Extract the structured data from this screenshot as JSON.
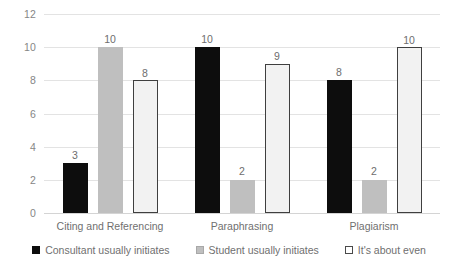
{
  "chart_data": {
    "type": "bar",
    "title": "",
    "subtitle": "",
    "xlabel": "",
    "ylabel": "",
    "ylim": [
      0,
      12
    ],
    "ytick_step": 2,
    "yticks": [
      "12",
      "10",
      "8",
      "6",
      "4",
      "2",
      "0"
    ],
    "grid": true,
    "legend_position": "bottom",
    "categories": [
      "Citing and Referencing",
      "Paraphrasing",
      "Plagiarism"
    ],
    "series": [
      {
        "name": "Consultant usually initiates",
        "color": "#0d0d0d",
        "values": [
          3,
          10,
          8
        ],
        "labels": [
          "3",
          "10",
          "8"
        ]
      },
      {
        "name": "Student usually initiates",
        "color": "#bfbfbf",
        "values": [
          10,
          2,
          2
        ],
        "labels": [
          "10",
          "2",
          "2"
        ]
      },
      {
        "name": "It's about even",
        "color": "#f2f2f2",
        "values": [
          8,
          9,
          10
        ],
        "labels": [
          "8",
          "9",
          "10"
        ]
      }
    ]
  },
  "style": {
    "gridline_color": "#e3e3e3",
    "axis_text_color": "#868686",
    "label_text_color": "#6f6f6f",
    "background": "#ffffff"
  }
}
